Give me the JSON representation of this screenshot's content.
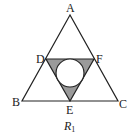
{
  "figure": {
    "caption": "R",
    "caption_subscript": "1",
    "colors": {
      "stroke": "#222222",
      "shaded": "#9a9a9a",
      "circle_fill": "#ffffff",
      "background": "#ffffff"
    },
    "points": [
      {
        "name": "A",
        "x": 70,
        "y": 15
      },
      {
        "name": "B",
        "x": 22,
        "y": 101
      },
      {
        "name": "C",
        "x": 118,
        "y": 101
      },
      {
        "name": "D",
        "x": 46,
        "y": 59
      },
      {
        "name": "E",
        "x": 70,
        "y": 101
      },
      {
        "name": "F",
        "x": 94,
        "y": 59
      }
    ],
    "labels": {
      "A": "A",
      "B": "B",
      "C": "C",
      "D": "D",
      "E": "E",
      "F": "F"
    },
    "outer_triangle": "ABC",
    "inner_triangle": "DEF (shaded)",
    "inscribed_circle": {
      "cx": 70,
      "cy": 73,
      "r": 14
    }
  }
}
